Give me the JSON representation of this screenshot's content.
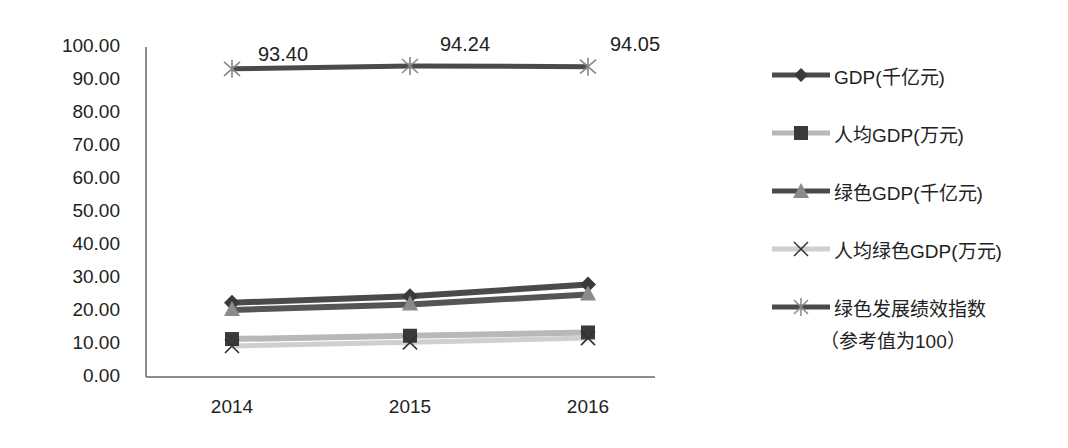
{
  "chart_data": {
    "type": "line",
    "title": "",
    "xlabel": "",
    "ylabel": "",
    "categories": [
      "2014",
      "2015",
      "2016"
    ],
    "ylim": [
      0,
      100
    ],
    "yticks": [
      "100.00",
      "90.00",
      "80.00",
      "70.00",
      "60.00",
      "50.00",
      "40.00",
      "30.00",
      "20.00",
      "10.00",
      "0.00"
    ],
    "grid": false,
    "legend_position": "right",
    "series": [
      {
        "name": "GDP(千亿元)",
        "marker": "diamond",
        "color": "#4a4a4a",
        "values": [
          22.5,
          24.5,
          28.0
        ]
      },
      {
        "name": "人均GDP(万元)",
        "marker": "square",
        "color": "#b8b8b8",
        "values": [
          11.5,
          12.5,
          13.5
        ]
      },
      {
        "name": "绿色GDP(千亿元)",
        "marker": "triangle",
        "color": "#555555",
        "values": [
          20.3,
          22.0,
          25.0
        ]
      },
      {
        "name": "人均绿色GDP(万元)",
        "marker": "x",
        "color": "#c8c8c8",
        "values": [
          9.4,
          10.5,
          11.8
        ]
      },
      {
        "name": "绿色发展绩效指数（参考值为100）",
        "marker": "star",
        "color": "#4a4a4a",
        "values": [
          93.4,
          94.24,
          94.05
        ]
      }
    ],
    "annotations": [
      "93.40",
      "94.24",
      "94.05"
    ]
  },
  "legend": {
    "items": [
      {
        "label": "GDP(千亿元)"
      },
      {
        "label": "人均GDP(万元)"
      },
      {
        "label": "绿色GDP(千亿元)"
      },
      {
        "label": "人均绿色GDP(万元)"
      },
      {
        "label": "绿色发展绩效指数",
        "sub": "（参考值为100）"
      }
    ]
  }
}
